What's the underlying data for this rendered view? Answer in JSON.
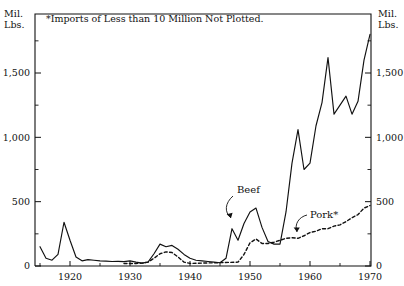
{
  "chart_data": {
    "type": "line",
    "title": "",
    "note": "*Imports of Less than 10 Million Not Plotted.",
    "xlabel": "",
    "ylabel": "Mil.\nLbs.",
    "ylabel_right": "Mil.\nLbs.",
    "xlim": [
      1915,
      1971
    ],
    "ylim": [
      0,
      1900
    ],
    "grid": false,
    "legend": "inline-annotations",
    "ytick_labels": [
      "0",
      "500",
      "1,000",
      "1,500"
    ],
    "ytick_values": [
      0,
      500,
      1000,
      1500
    ],
    "yminor_values": [
      250,
      750,
      1250,
      1750
    ],
    "xtick_labels": [
      "1920",
      "1930",
      "1940",
      "1950",
      "1960",
      "1970"
    ],
    "xtick_values": [
      1920,
      1930,
      1940,
      1950,
      1960,
      1970
    ],
    "xminor_values": [
      1915,
      1925,
      1935,
      1945,
      1955,
      1965
    ],
    "annotations": [
      {
        "name": "beef",
        "label": "Beef",
        "x": 1951.2,
        "y": 600
      },
      {
        "name": "pork",
        "label": "Pork*",
        "x": 1963.0,
        "y": 380
      }
    ],
    "series": [
      {
        "name": "Beef",
        "style": "solid",
        "x": [
          1915,
          1916,
          1917,
          1918,
          1919,
          1920,
          1921,
          1922,
          1923,
          1924,
          1925,
          1926,
          1927,
          1928,
          1929,
          1930,
          1931,
          1932,
          1933,
          1934,
          1935,
          1936,
          1937,
          1938,
          1939,
          1940,
          1941,
          1942,
          1943,
          1944,
          1945,
          1946,
          1947,
          1948,
          1949,
          1950,
          1951,
          1952,
          1953,
          1954,
          1955,
          1956,
          1957,
          1958,
          1959,
          1960,
          1961,
          1962,
          1963,
          1964,
          1965,
          1966,
          1967,
          1968,
          1969,
          1970
        ],
        "values": [
          150,
          60,
          45,
          90,
          340,
          200,
          70,
          40,
          50,
          45,
          40,
          38,
          35,
          36,
          34,
          40,
          30,
          22,
          30,
          95,
          170,
          150,
          160,
          130,
          90,
          60,
          45,
          40,
          35,
          30,
          25,
          60,
          290,
          200,
          330,
          420,
          450,
          300,
          190,
          170,
          170,
          420,
          800,
          1060,
          750,
          800,
          1090,
          1270,
          1620,
          1180,
          1250,
          1320,
          1180,
          1280,
          1600,
          1800
        ]
      },
      {
        "name": "Pork",
        "style": "dashed",
        "x": [
          1929,
          1930,
          1931,
          1932,
          1933,
          1934,
          1935,
          1936,
          1937,
          1938,
          1939,
          1940,
          1948,
          1949,
          1950,
          1951,
          1952,
          1953,
          1954,
          1955,
          1956,
          1957,
          1958,
          1959,
          1960,
          1961,
          1962,
          1963,
          1964,
          1965,
          1966,
          1967,
          1968,
          1969,
          1970
        ],
        "values": [
          20,
          20,
          20,
          22,
          30,
          60,
          95,
          110,
          105,
          70,
          30,
          20,
          30,
          90,
          180,
          210,
          175,
          175,
          185,
          200,
          215,
          220,
          215,
          235,
          260,
          270,
          290,
          290,
          310,
          320,
          345,
          375,
          400,
          450,
          470
        ]
      }
    ]
  },
  "axes": {
    "left_unit": "Mil.\nLbs.",
    "right_unit": "Mil.\nLbs."
  }
}
